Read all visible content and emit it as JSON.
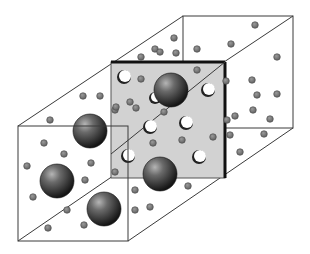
{
  "diagram": {
    "title": "",
    "colors": {
      "background": "#ffffff",
      "edge": "#3a3a3a",
      "thick_edge": "#111111",
      "plane_fill": "#d2d2d2",
      "small_particle": "#7a7a7a",
      "small_particle_stroke": "#4a4a4a",
      "large_sphere_light": "#9a9a9a",
      "large_sphere_dark": "#1e1e1e",
      "void_fill": "#ffffff"
    },
    "boxes": {
      "front": {
        "x1": 18,
        "y1": 126,
        "x2": 128,
        "y2": 241
      },
      "middle_plane": {
        "x1": 111,
        "y1": 62,
        "x2": 225,
        "y2": 178
      },
      "back": {
        "x1": 183,
        "y1": 16,
        "x2": 293,
        "y2": 128
      }
    },
    "large_spheres": [
      {
        "cx": 171,
        "cy": 90,
        "r": 17
      },
      {
        "cx": 90,
        "cy": 131,
        "r": 17
      },
      {
        "cx": 57,
        "cy": 181,
        "r": 17
      },
      {
        "cx": 104,
        "cy": 209,
        "r": 17
      },
      {
        "cx": 160,
        "cy": 174,
        "r": 17
      }
    ],
    "voids": [
      {
        "cx": 124,
        "cy": 77,
        "r": 6
      },
      {
        "cx": 155,
        "cy": 98,
        "r": 5
      },
      {
        "cx": 208,
        "cy": 90,
        "r": 6
      },
      {
        "cx": 150,
        "cy": 127,
        "r": 6
      },
      {
        "cx": 186,
        "cy": 123,
        "r": 6
      },
      {
        "cx": 128,
        "cy": 156,
        "r": 6
      },
      {
        "cx": 199,
        "cy": 157,
        "r": 6
      }
    ],
    "small_particles": [
      {
        "cx": 141,
        "cy": 57
      },
      {
        "cx": 141,
        "cy": 79
      },
      {
        "cx": 83,
        "cy": 96
      },
      {
        "cx": 100,
        "cy": 96
      },
      {
        "cx": 115,
        "cy": 110
      },
      {
        "cx": 136,
        "cy": 108
      },
      {
        "cx": 50,
        "cy": 120
      },
      {
        "cx": 155,
        "cy": 49
      },
      {
        "cx": 174,
        "cy": 38
      },
      {
        "cx": 160,
        "cy": 52
      },
      {
        "cx": 197,
        "cy": 49
      },
      {
        "cx": 176,
        "cy": 53
      },
      {
        "cx": 231,
        "cy": 44
      },
      {
        "cx": 255,
        "cy": 25
      },
      {
        "cx": 252,
        "cy": 80
      },
      {
        "cx": 277,
        "cy": 57
      },
      {
        "cx": 197,
        "cy": 70
      },
      {
        "cx": 226,
        "cy": 81
      },
      {
        "cx": 130,
        "cy": 102
      },
      {
        "cx": 116,
        "cy": 107
      },
      {
        "cx": 164,
        "cy": 112
      },
      {
        "cx": 257,
        "cy": 95
      },
      {
        "cx": 277,
        "cy": 94
      },
      {
        "cx": 253,
        "cy": 110
      },
      {
        "cx": 235,
        "cy": 116
      },
      {
        "cx": 270,
        "cy": 119
      },
      {
        "cx": 213,
        "cy": 137
      },
      {
        "cx": 182,
        "cy": 140
      },
      {
        "cx": 153,
        "cy": 143
      },
      {
        "cx": 230,
        "cy": 135
      },
      {
        "cx": 264,
        "cy": 134
      },
      {
        "cx": 240,
        "cy": 152
      },
      {
        "cx": 227,
        "cy": 120
      },
      {
        "cx": 44,
        "cy": 143
      },
      {
        "cx": 64,
        "cy": 154
      },
      {
        "cx": 27,
        "cy": 166
      },
      {
        "cx": 91,
        "cy": 163
      },
      {
        "cx": 85,
        "cy": 180
      },
      {
        "cx": 33,
        "cy": 197
      },
      {
        "cx": 67,
        "cy": 210
      },
      {
        "cx": 48,
        "cy": 228
      },
      {
        "cx": 84,
        "cy": 225
      },
      {
        "cx": 115,
        "cy": 172
      },
      {
        "cx": 135,
        "cy": 190
      },
      {
        "cx": 135,
        "cy": 210
      },
      {
        "cx": 150,
        "cy": 207
      },
      {
        "cx": 188,
        "cy": 186
      }
    ]
  }
}
